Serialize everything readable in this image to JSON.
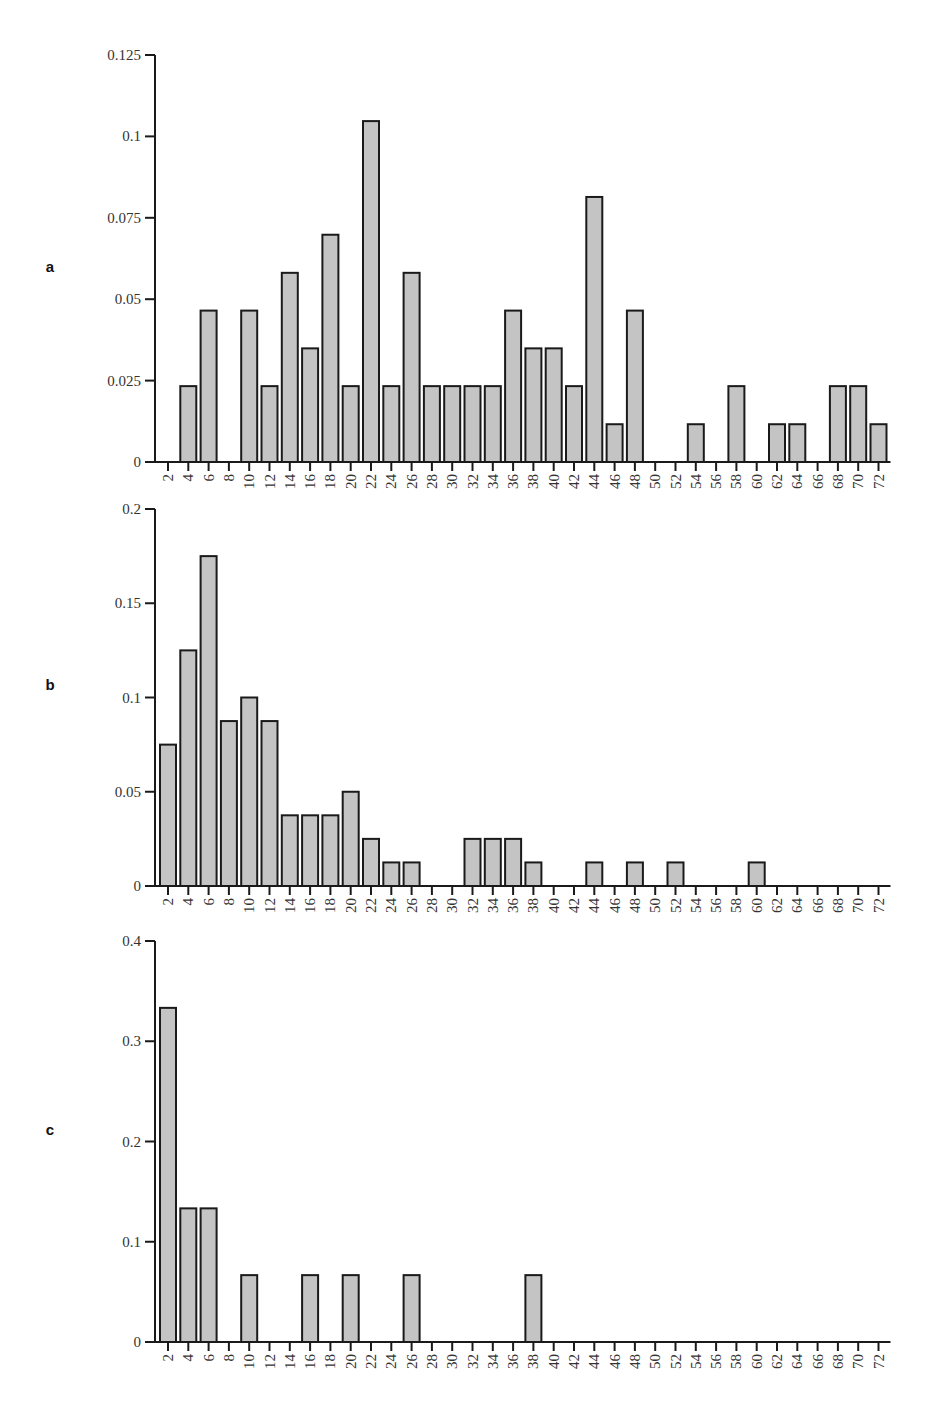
{
  "chart_data": [
    {
      "type": "bar",
      "panel": "a",
      "title": "",
      "xlabel": "",
      "ylabel": "",
      "ylim": [
        0,
        0.125
      ],
      "yticks": [
        "0",
        "0.025",
        "0.05",
        "0.075",
        "0.1",
        "0.125"
      ],
      "categories": [
        "2",
        "4",
        "6",
        "8",
        "10",
        "12",
        "14",
        "16",
        "18",
        "20",
        "22",
        "24",
        "26",
        "28",
        "30",
        "32",
        "34",
        "36",
        "38",
        "40",
        "42",
        "44",
        "46",
        "48",
        "50",
        "52",
        "54",
        "56",
        "58",
        "60",
        "62",
        "64",
        "66",
        "68",
        "70",
        "72"
      ],
      "values": [
        0,
        0.0233,
        0.0465,
        0,
        0.0465,
        0.0233,
        0.0581,
        0.0349,
        0.0698,
        0.0233,
        0.1047,
        0.0233,
        0.0581,
        0.0233,
        0.0233,
        0.0233,
        0.0233,
        0.0465,
        0.0349,
        0.0349,
        0.0233,
        0.0814,
        0.0116,
        0.0465,
        0,
        0,
        0.0116,
        0,
        0.0233,
        0,
        0.0116,
        0.0116,
        0,
        0.0233,
        0.0233,
        0.0116
      ],
      "grid": false
    },
    {
      "type": "bar",
      "panel": "b",
      "title": "",
      "xlabel": "",
      "ylabel": "",
      "ylim": [
        0,
        0.2
      ],
      "yticks": [
        "0",
        "0.05",
        "0.1",
        "0.15",
        "0.2"
      ],
      "categories": [
        "2",
        "4",
        "6",
        "8",
        "10",
        "12",
        "14",
        "16",
        "18",
        "20",
        "22",
        "24",
        "26",
        "28",
        "30",
        "32",
        "34",
        "36",
        "38",
        "40",
        "42",
        "44",
        "46",
        "48",
        "50",
        "52",
        "54",
        "56",
        "58",
        "60",
        "62",
        "64",
        "66",
        "68",
        "70",
        "72"
      ],
      "values": [
        0.075,
        0.125,
        0.175,
        0.0875,
        0.1,
        0.0875,
        0.0375,
        0.0375,
        0.0375,
        0.05,
        0.025,
        0.0125,
        0.0125,
        0,
        0,
        0.025,
        0.025,
        0.025,
        0.0125,
        0,
        0,
        0.0125,
        0,
        0.0125,
        0,
        0.0125,
        0,
        0,
        0,
        0.0125,
        0,
        0,
        0,
        0,
        0,
        0
      ],
      "grid": false
    },
    {
      "type": "bar",
      "panel": "c",
      "title": "",
      "xlabel": "",
      "ylabel": "",
      "ylim": [
        0,
        0.4
      ],
      "yticks": [
        "0",
        "0.1",
        "0.2",
        "0.3",
        "0.4"
      ],
      "categories": [
        "2",
        "4",
        "6",
        "8",
        "10",
        "12",
        "14",
        "16",
        "18",
        "20",
        "22",
        "24",
        "26",
        "28",
        "30",
        "32",
        "34",
        "36",
        "38",
        "40",
        "42",
        "44",
        "46",
        "48",
        "50",
        "52",
        "54",
        "56",
        "58",
        "60",
        "62",
        "64",
        "66",
        "68",
        "70",
        "72"
      ],
      "values": [
        0.3333,
        0.1333,
        0.1333,
        0,
        0.0667,
        0,
        0,
        0.0667,
        0,
        0.0667,
        0,
        0,
        0.0667,
        0,
        0,
        0,
        0,
        0,
        0.0667,
        0,
        0,
        0,
        0,
        0,
        0,
        0,
        0,
        0,
        0,
        0,
        0,
        0,
        0,
        0,
        0,
        0
      ],
      "grid": false
    }
  ],
  "panels": [
    {
      "label": "a",
      "top": 55,
      "bottom": 462,
      "labelY": 272
    },
    {
      "label": "b",
      "top": 509,
      "bottom": 886,
      "labelY": 690
    },
    {
      "label": "c",
      "top": 941,
      "bottom": 1342,
      "labelY": 1135
    }
  ]
}
